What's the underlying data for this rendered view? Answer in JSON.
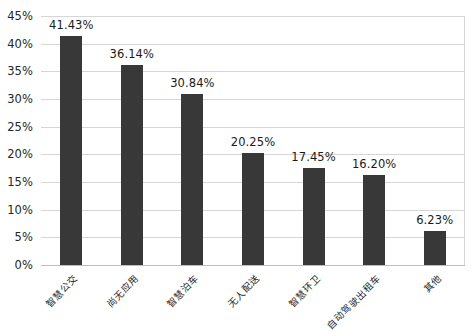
{
  "chart_data": {
    "type": "bar",
    "title": "",
    "subtitle": "",
    "xlabel": "",
    "ylabel": "",
    "categories": [
      "智慧公交",
      "尚无应用",
      "智慧泊车",
      "无人配送",
      "智慧环卫",
      "自动驾驶出租车",
      "其他"
    ],
    "values": [
      41.43,
      36.14,
      30.84,
      20.25,
      17.45,
      16.2,
      6.23
    ],
    "value_labels": [
      "41.43%",
      "36.14%",
      "30.84%",
      "20.25%",
      "17.45%",
      "16.20%",
      "6.23%"
    ],
    "ylim": [
      0,
      45
    ],
    "ytick_values": [
      45,
      40,
      35,
      30,
      25,
      20,
      15,
      10,
      5,
      0
    ],
    "ytick_labels": [
      "45%",
      "40%",
      "35%",
      "30%",
      "25%",
      "20%",
      "15%",
      "10%",
      "5%",
      "0%"
    ],
    "grid": true,
    "legend": false,
    "legend_position": "none",
    "series_color": "#383838",
    "gridline_color": "#d6d6d6",
    "axis_color": "#bdbdbd",
    "background_color": "#ffffff",
    "label_rotation_degrees": -45
  }
}
